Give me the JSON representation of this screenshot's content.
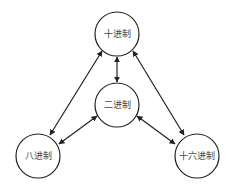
{
  "diagram": {
    "nodes": [
      {
        "id": "decimal",
        "label": "十进制",
        "cx": 117,
        "cy": 34,
        "r": 22
      },
      {
        "id": "binary",
        "label": "二进制",
        "cx": 117,
        "cy": 105,
        "r": 22
      },
      {
        "id": "octal",
        "label": "八进制",
        "cx": 38,
        "cy": 156,
        "r": 22
      },
      {
        "id": "hex",
        "label": "十六进制",
        "cx": 197,
        "cy": 156,
        "r": 22
      }
    ],
    "edges": [
      {
        "from": "decimal",
        "to": "binary",
        "bidirectional": true
      },
      {
        "from": "decimal",
        "to": "octal",
        "bidirectional": true
      },
      {
        "from": "decimal",
        "to": "hex",
        "bidirectional": true
      },
      {
        "from": "binary",
        "to": "octal",
        "bidirectional": true
      },
      {
        "from": "binary",
        "to": "hex",
        "bidirectional": true
      }
    ],
    "colors": {
      "stroke": "#222222",
      "text": "#444444",
      "background": "#ffffff"
    }
  }
}
